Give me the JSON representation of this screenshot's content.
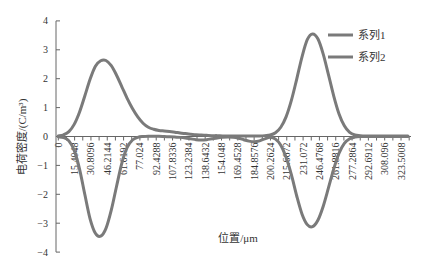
{
  "chart_data": {
    "type": "line",
    "title": "",
    "xlabel": "位置/μm",
    "ylabel": "电荷密度/(C/m³)",
    "ylim": [
      -4,
      4
    ],
    "xlim": [
      0,
      330
    ],
    "y_ticks": [
      "4",
      "3",
      "2",
      "1",
      "0",
      "-1",
      "-2",
      "-3",
      "-4"
    ],
    "x_ticks": [
      "0",
      "15.4048",
      "30.8096",
      "46.2144",
      "61.6192",
      "77.024",
      "92.4288",
      "107.8336",
      "123.2384",
      "138.6432",
      "154.048",
      "169.4528",
      "184.8576",
      "200.2624",
      "215.6672",
      "231.072",
      "246.4768",
      "261.8816",
      "277.2864",
      "292.6912",
      "308.096",
      "323.5008"
    ],
    "grid": false,
    "legend_position": "top-right",
    "x": [
      0,
      5,
      10,
      15,
      20,
      25,
      30,
      35,
      40,
      45,
      50,
      55,
      60,
      65,
      70,
      75,
      80,
      85,
      90,
      95,
      100,
      105,
      110,
      115,
      120,
      125,
      130,
      135,
      140,
      145,
      150,
      155,
      160,
      165,
      170,
      175,
      180,
      185,
      190,
      195,
      200,
      205,
      210,
      215,
      220,
      225,
      230,
      235,
      240,
      245,
      250,
      255,
      260,
      265,
      270,
      275,
      280,
      285,
      290,
      295,
      300,
      305,
      310,
      315,
      320,
      325,
      330
    ],
    "series": [
      {
        "name": "系列1",
        "color": "#7a7a7a",
        "values": [
          0.02,
          0.06,
          0.17,
          0.42,
          0.84,
          1.4,
          1.98,
          2.43,
          2.62,
          2.63,
          2.45,
          2.12,
          1.72,
          1.32,
          0.97,
          0.68,
          0.46,
          0.32,
          0.25,
          0.21,
          0.19,
          0.17,
          0.15,
          0.12,
          0.1,
          0.08,
          0.06,
          0.05,
          0.04,
          0.03,
          0.03,
          0.02,
          0.02,
          0.02,
          0.02,
          0.02,
          0.02,
          0.02,
          0.02,
          0.03,
          0.05,
          0.13,
          0.32,
          0.68,
          1.25,
          1.98,
          2.75,
          3.35,
          3.55,
          3.38,
          2.86,
          2.14,
          1.4,
          0.78,
          0.37,
          0.14,
          0.05,
          0.03,
          0.02,
          0.02,
          0.02,
          0.02,
          0.02,
          0.02,
          0.02,
          0.02,
          0.02
        ]
      },
      {
        "name": "系列2",
        "color": "#7a7a7a",
        "values": [
          -0.01,
          -0.04,
          -0.15,
          -0.48,
          -1.12,
          -2.0,
          -2.85,
          -3.35,
          -3.45,
          -3.18,
          -2.55,
          -1.72,
          -0.92,
          -0.38,
          -0.12,
          -0.03,
          0.0,
          0.01,
          0.01,
          0.01,
          0.0,
          -0.01,
          -0.02,
          -0.03,
          -0.05,
          -0.08,
          -0.11,
          -0.12,
          -0.11,
          -0.08,
          -0.05,
          -0.03,
          -0.02,
          -0.03,
          -0.06,
          -0.11,
          -0.16,
          -0.18,
          -0.15,
          -0.08,
          -0.03,
          -0.09,
          -0.3,
          -0.72,
          -1.32,
          -2.05,
          -2.68,
          -3.05,
          -3.12,
          -2.9,
          -2.42,
          -1.78,
          -1.12,
          -0.58,
          -0.24,
          -0.08,
          -0.02,
          0.0,
          0.0,
          0.0,
          0.0,
          0.0,
          0.0,
          0.0,
          0.0,
          0.0,
          0.0
        ]
      }
    ]
  }
}
